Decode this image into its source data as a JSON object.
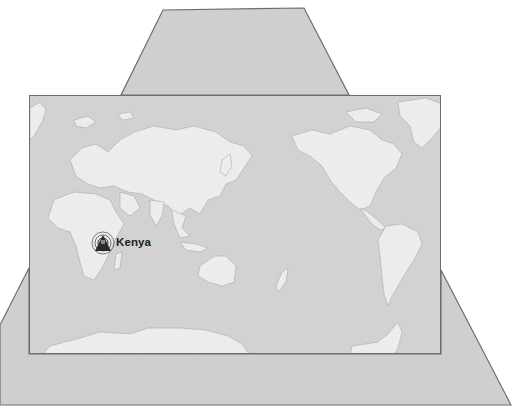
{
  "map": {
    "title": "World map",
    "projection": "Pacific-centred world map",
    "colors": {
      "background": "#ffffff",
      "panel_fill": "#cfcfcf",
      "panel_stroke": "#6e6e6e",
      "ocean": "#d2d2d2",
      "land": "#f4f4f4",
      "relief": "#bdbdbd",
      "marker": "#2a2a2a"
    },
    "top_panel": {
      "points": "163,10 304,8 349,95 121,95"
    },
    "bottom_panel": {
      "points": "29,268 29,354 441,354 441,270 511,405 0,405 0,325"
    },
    "marker": {
      "icon": "radio-tower-icon",
      "label": "Kenya",
      "x": 103,
      "y": 243
    }
  }
}
